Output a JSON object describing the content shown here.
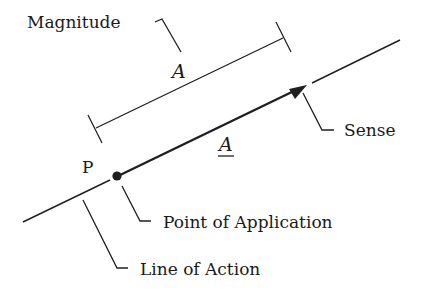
{
  "diagram": {
    "labels": {
      "magnitude": "Magnitude",
      "magnitude_symbol": "A",
      "vector_symbol": "A",
      "point": "P",
      "sense": "Sense",
      "point_of_application": "Point of Application",
      "line_of_action": "Line of Action"
    },
    "colors": {
      "ink": "#1f1f1f",
      "background": "#ffffff"
    }
  }
}
